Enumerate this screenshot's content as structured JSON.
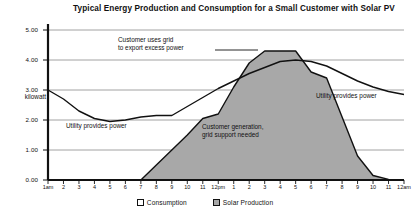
{
  "chart_data": {
    "type": "area",
    "title": "Typical Energy Production and Consumption for a Small Customer with Solar PV",
    "xlabel": "",
    "ylabel": "kilowatt",
    "ylim": [
      0,
      5
    ],
    "yticks": [
      "0.00",
      "1.00",
      "2.00",
      "3.00",
      "4.00",
      "5.00"
    ],
    "grid": true,
    "legend_position": "bottom-center",
    "x": [
      "1am",
      "2",
      "3",
      "4",
      "5",
      "6",
      "7",
      "8",
      "9",
      "10",
      "11",
      "12pm",
      "1",
      "2",
      "3",
      "4",
      "5",
      "6",
      "7",
      "8",
      "9",
      "10",
      "11",
      "12am"
    ],
    "series": [
      {
        "name": "Consumption",
        "style": "line",
        "color": "#111111",
        "values": [
          3.0,
          2.7,
          2.3,
          2.05,
          1.95,
          2.0,
          2.1,
          2.15,
          2.15,
          2.45,
          2.75,
          3.05,
          3.3,
          3.55,
          3.75,
          3.95,
          4.0,
          3.95,
          3.8,
          3.55,
          3.3,
          3.1,
          2.95,
          2.85
        ]
      },
      {
        "name": "Solar Production",
        "style": "filled-area",
        "color": "#a8a8a8",
        "values": [
          0.0,
          0.0,
          0.0,
          0.0,
          0.0,
          0.0,
          0.0,
          0.5,
          1.0,
          1.5,
          2.05,
          2.2,
          3.1,
          3.9,
          4.3,
          4.3,
          4.3,
          3.6,
          3.4,
          2.1,
          0.8,
          0.15,
          0.02,
          0.0
        ]
      }
    ],
    "annotations": [
      {
        "id": "export",
        "text_lines": [
          "Customer uses grid",
          "to export excess power"
        ]
      },
      {
        "id": "utility-left",
        "text_lines": [
          "Utility provides power"
        ]
      },
      {
        "id": "utility-right",
        "text_lines": [
          "Utility provides power"
        ]
      },
      {
        "id": "generation",
        "text_lines": [
          "Customer generation,",
          "grid support needed"
        ]
      }
    ]
  },
  "legend": {
    "items": [
      {
        "label": "Consumption",
        "swatch": "hollow"
      },
      {
        "label": "Solar Production",
        "swatch": "solid"
      }
    ]
  }
}
